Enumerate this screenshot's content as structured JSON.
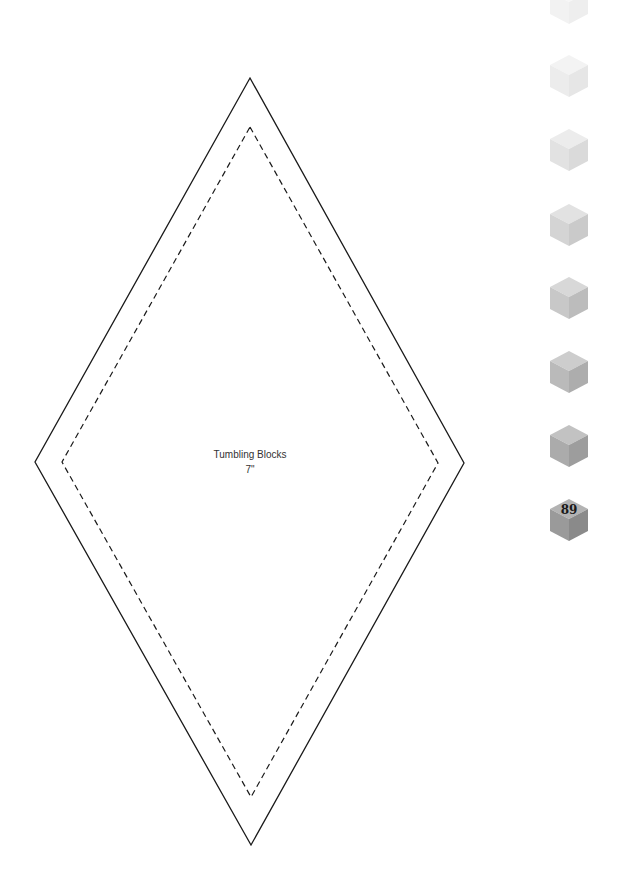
{
  "template": {
    "name": "Tumbling Blocks",
    "size": "7\"",
    "outer_diamond": {
      "top": [
        250,
        78
      ],
      "right": [
        464,
        463
      ],
      "bottom": [
        251,
        845
      ],
      "left": [
        35,
        462
      ]
    },
    "inner_diamond": {
      "top": [
        250,
        127
      ],
      "right": [
        438,
        463
      ],
      "bottom": [
        251,
        797
      ],
      "left": [
        62,
        462
      ]
    }
  },
  "page": {
    "number": "89"
  },
  "side_tabs": {
    "cubes": [
      {
        "center_y": 3,
        "top": "#f6f6f6",
        "left": "#f2f2f2",
        "right": "#eeeeee"
      },
      {
        "center_y": 76,
        "top": "#f3f3f3",
        "left": "#ececec",
        "right": "#e6e6e6"
      },
      {
        "center_y": 150,
        "top": "#ececec",
        "left": "#e2e2e2",
        "right": "#dadada"
      },
      {
        "center_y": 225,
        "top": "#e2e2e2",
        "left": "#d4d4d4",
        "right": "#cacaca"
      },
      {
        "center_y": 298,
        "top": "#d8d8d8",
        "left": "#c8c8c8",
        "right": "#bcbcbc"
      },
      {
        "center_y": 372,
        "top": "#cdcdcd",
        "left": "#bababa",
        "right": "#adadad"
      },
      {
        "center_y": 446,
        "top": "#c2c2c2",
        "left": "#ababab",
        "right": "#9d9d9d"
      },
      {
        "center_y": 520,
        "top": "#b3b3b3",
        "left": "#9a9a9a",
        "right": "#8a8a8a"
      }
    ]
  }
}
